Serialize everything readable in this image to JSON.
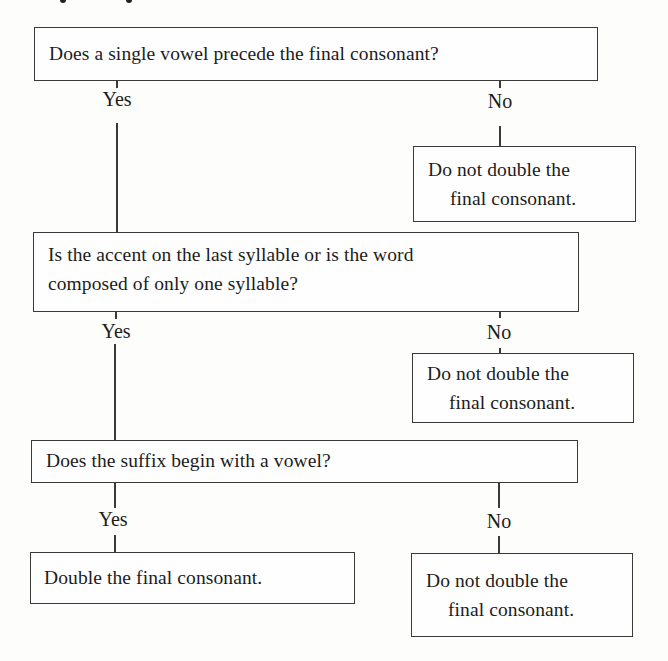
{
  "flowchart": {
    "q1": {
      "text": "Does a single vowel precede the final consonant?",
      "yes_label": "Yes",
      "no_label": "No",
      "no_result": [
        "Do not double the",
        "final consonant."
      ]
    },
    "q2": {
      "text": [
        "Is the accent on the last syllable or is the word",
        "composed of only one syllable?"
      ],
      "yes_label": "Yes",
      "no_label": "No",
      "no_result": [
        "Do not double the",
        "final consonant."
      ]
    },
    "q3": {
      "text": "Does the suffix begin with a vowel?",
      "yes_label": "Yes",
      "no_label": "No",
      "yes_result": "Double the final consonant.",
      "no_result": [
        "Do not double the",
        "final consonant."
      ]
    }
  }
}
